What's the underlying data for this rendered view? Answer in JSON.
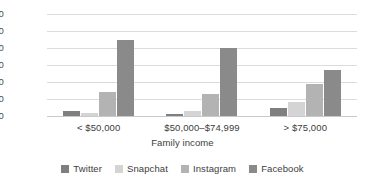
{
  "chart_data": {
    "type": "bar",
    "title": "",
    "xlabel": "Family income",
    "ylabel": "Percentage",
    "categories": [
      "< $50,000",
      "$50,000–$74,999",
      "> $75,000"
    ],
    "series": [
      {
        "name": "Twitter",
        "color": "#7f7f7f",
        "values": [
          3,
          1,
          5
        ]
      },
      {
        "name": "Snapchat",
        "color": "#d4d4d4",
        "values": [
          2,
          3,
          8
        ]
      },
      {
        "name": "Instagram",
        "color": "#b3b3b3",
        "values": [
          14,
          13,
          19
        ]
      },
      {
        "name": "Facebook",
        "color": "#8a8a8a",
        "values": [
          45,
          40,
          27
        ]
      }
    ],
    "ylim": [
      0,
      60
    ],
    "yticks": [
      0,
      10,
      20,
      30,
      40,
      50,
      60
    ],
    "ytick_labels": [
      "0",
      "10",
      "20",
      "30",
      "40",
      "50",
      "60"
    ],
    "grid": true,
    "legend_position": "bottom"
  },
  "colors": {
    "gridline": "#dcdcdc",
    "baseline": "#c9c9c9",
    "text": "#3d3d3d",
    "background": "#ffffff"
  }
}
